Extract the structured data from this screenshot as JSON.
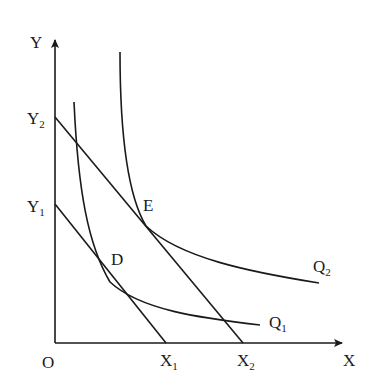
{
  "diagram": {
    "type": "isoquant-isocost",
    "axes": {
      "origin_label": "O",
      "x_axis": {
        "label": "X"
      },
      "y_axis": {
        "label": "Y"
      }
    },
    "isocost_lines": [
      {
        "id": "low",
        "y_intercept": {
          "label": "Y",
          "sub": "1"
        },
        "x_intercept": {
          "label": "X",
          "sub": "1"
        }
      },
      {
        "id": "high",
        "y_intercept": {
          "label": "Y",
          "sub": "2"
        },
        "x_intercept": {
          "label": "X",
          "sub": "2"
        }
      }
    ],
    "isoquants": [
      {
        "id": "Q1",
        "label": "Q",
        "sub": "1"
      },
      {
        "id": "Q2",
        "label": "Q",
        "sub": "2"
      }
    ],
    "points": [
      {
        "id": "D",
        "label": "D",
        "desc": "tangency of Q1 and Y1X1"
      },
      {
        "id": "E",
        "label": "E",
        "desc": "tangency of Q2 and Y2X2"
      }
    ],
    "colors": {
      "ink": "#1a1a1a",
      "background": "#ffffff"
    }
  }
}
